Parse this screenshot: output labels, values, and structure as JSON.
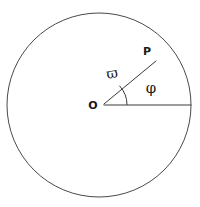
{
  "figure": {
    "type": "polar-coordinate-diagram",
    "background_color": "#ffffff",
    "stroke_color": "#3a3a3a",
    "label_color": "#1a1a1a"
  },
  "circle": {
    "name": "boundary-circle",
    "center_x": 99,
    "center_y": 105,
    "radius": 92
  },
  "origin": {
    "label": "O",
    "x": 99,
    "y": 105,
    "label_x": 93,
    "label_y": 109
  },
  "point_p": {
    "label": "P",
    "x": 155,
    "y": 61,
    "label_x": 146,
    "label_y": 54
  },
  "reference_ray": {
    "name": "horizontal-reference-ray",
    "x1": 104,
    "y1": 105,
    "x2": 191,
    "y2": 105
  },
  "radius_line": {
    "name": "radius-vector-op",
    "x1": 104,
    "y1": 104,
    "x2": 156,
    "y2": 61
  },
  "angle_arc": {
    "name": "angle-arc-phi",
    "radius": 28,
    "path": "M 127 105 A 28 28 0 0 0 119.4 85.7"
  },
  "radius_label": {
    "text": "ϖ",
    "fallback_text": "ω̃",
    "x": 113,
    "y": 78
  },
  "angle_label": {
    "text": "φ",
    "x": 151,
    "y": 93
  }
}
